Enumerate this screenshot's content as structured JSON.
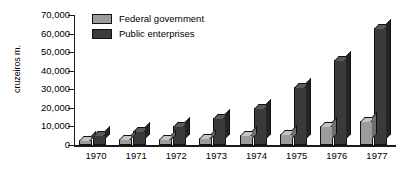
{
  "chart_data": {
    "type": "bar",
    "title": "",
    "subtitle": "",
    "xlabel": "",
    "ylabel": "cruzeiros m.",
    "categories": [
      "1970",
      "1971",
      "1972",
      "1973",
      "1974",
      "1975",
      "1976",
      "1977"
    ],
    "series": [
      {
        "name": "Federal government",
        "color": "#9c9c9c",
        "values": [
          2500,
          3000,
          3500,
          4000,
          5500,
          6000,
          10000,
          13000
        ]
      },
      {
        "name": "Public enterprises",
        "color": "#3a3a3a",
        "values": [
          5500,
          7500,
          10000,
          14500,
          20000,
          31000,
          46000,
          63000
        ]
      }
    ],
    "ylim": [
      0,
      70000
    ],
    "ytick_values": [
      0,
      10000,
      20000,
      30000,
      40000,
      50000,
      60000,
      70000
    ],
    "ytick_labels": [
      "0",
      "10,000",
      "20,000",
      "30,000",
      "40,000",
      "50,000",
      "60,000",
      "70,000"
    ],
    "grid": false,
    "legend_position": "top-left",
    "style": "3d-grouped-bar"
  }
}
